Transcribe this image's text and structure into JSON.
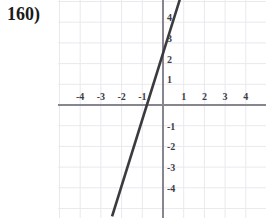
{
  "problem": {
    "label": "160)"
  },
  "colors": {
    "background": "#ffffff",
    "grid": "#e9e9ee",
    "axis": "#868690",
    "line": "#3b3b3f",
    "tick_text": "#3c3c44",
    "label_text": "#1b1b1b"
  },
  "chart_data": {
    "type": "line",
    "title": "",
    "xlabel": "",
    "ylabel": "",
    "xlim": [
      -5.1,
      5.0
    ],
    "ylim": [
      -5.5,
      5.1
    ],
    "grid": true,
    "legend": null,
    "x_ticks": [
      -4,
      -3,
      -2,
      -1,
      1,
      2,
      3,
      4
    ],
    "x_tick_labels": [
      "-4",
      "-3",
      "-2",
      "-1",
      "1",
      "2",
      "3",
      "4"
    ],
    "y_ticks": [
      4,
      3,
      2,
      1,
      -1,
      -2,
      -3,
      -4
    ],
    "y_tick_labels": [
      "4",
      "3",
      "2",
      "1",
      "-1",
      "-2",
      "-3",
      "-4"
    ],
    "series": [
      {
        "name": "line",
        "slope": 3.2,
        "y_intercept": 2.5,
        "x_intercept": -0.78,
        "x": [
          -2.46,
          0.82
        ],
        "values": [
          -5.38,
          5.12
        ]
      }
    ]
  },
  "geometry": {
    "origin_x": 105,
    "origin_y": 105,
    "unit_px": 20.7,
    "plot_left": 58,
    "plot_width": 208,
    "plot_height": 218
  }
}
